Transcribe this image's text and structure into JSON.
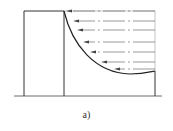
{
  "figure": {
    "caption": "a)",
    "stroke_color": "#333333",
    "flow_line_color": "#555555",
    "arrows": [
      {
        "y": 11,
        "x_head": 66
      },
      {
        "y": 21,
        "x_head": 73
      },
      {
        "y": 30,
        "x_head": 77
      },
      {
        "y": 42,
        "x_head": 83
      },
      {
        "y": 52,
        "x_head": 90
      },
      {
        "y": 62,
        "x_head": 101
      },
      {
        "y": 69,
        "x_head": 114
      }
    ]
  }
}
